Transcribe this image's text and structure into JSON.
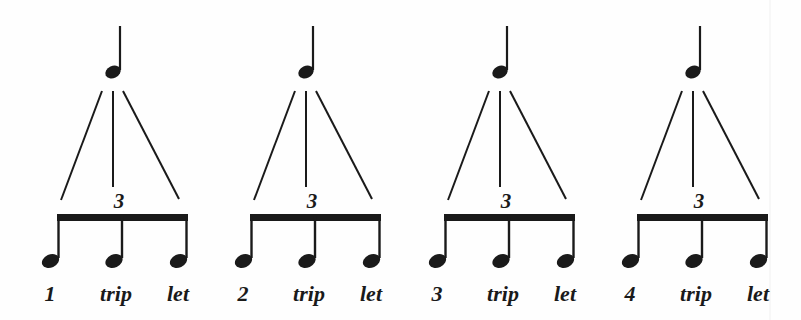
{
  "diagram": {
    "title": "",
    "tuplet_number": "3",
    "ink_color": "#1a1a1a",
    "groups": [
      {
        "beat": "1",
        "syllables": [
          "1",
          "trip",
          "let"
        ]
      },
      {
        "beat": "2",
        "syllables": [
          "2",
          "trip",
          "let"
        ]
      },
      {
        "beat": "3",
        "syllables": [
          "3",
          "trip",
          "let"
        ]
      },
      {
        "beat": "4",
        "syllables": [
          "4",
          "trip",
          "let"
        ]
      }
    ]
  }
}
